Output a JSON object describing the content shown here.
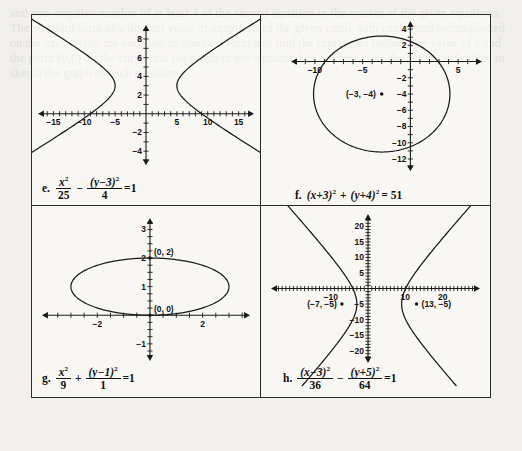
{
  "figure": {
    "border_color": "#2b2b2b",
    "background": "#f2f0ec",
    "panel_count": 4
  },
  "ghost_text": "and non-negative number of at least 1 of the second equation in the system of the given equations. The standard form of a distinct value of equations of the given circle with center and radius plotted on the axes. Write the equation in standard form and find the center and radius. The value of c and the point (0,0) on the curve that the graph of the equation has a vertex. Use the center and radius to sketch the graph of each equation.",
  "panels": [
    {
      "id": "e",
      "label": "e.",
      "curve_type": "hyperbola",
      "equation_text": "x^2/25 - (y-3)^2/4 = 1",
      "equation": {
        "term1": {
          "num": "x",
          "num_sup": "2",
          "den": "25"
        },
        "operator": "−",
        "term2": {
          "num": "(y−3)",
          "num_sup": "2",
          "den": "4"
        },
        "equals": "=1"
      },
      "axes": {
        "x_ticks": [
          "−15",
          "−10",
          "−5",
          "5",
          "10",
          "15"
        ],
        "x_tick_values": [
          -15,
          -10,
          -5,
          5,
          10,
          15
        ],
        "y_ticks": [
          "8",
          "6",
          "4",
          "2",
          "−2",
          "−4"
        ],
        "y_tick_values": [
          8,
          6,
          4,
          2,
          -2,
          -4
        ],
        "xlim": [
          -17.5,
          17.5
        ],
        "ylim": [
          -5.5,
          9.5
        ]
      },
      "center": [
        0,
        3
      ],
      "a": 5,
      "b": 2,
      "orientation": "horizontal"
    },
    {
      "id": "f",
      "label": "f.",
      "curve_type": "circle",
      "equation_text": "(x+3)^2 + (y+4)^2 = 51",
      "equation": {
        "term1": "(x+3)",
        "term1_sup": "2",
        "operator": "+",
        "term2": "(y+4)",
        "term2_sup": "2",
        "equals": "= 51"
      },
      "axes": {
        "x_ticks": [
          "−10",
          "−5",
          "5"
        ],
        "x_tick_values": [
          -10,
          -5,
          5
        ],
        "y_ticks": [
          "4",
          "2",
          "−2",
          "−4",
          "−6",
          "−8",
          "−10",
          "−12"
        ],
        "y_tick_values": [
          4,
          2,
          -2,
          -4,
          -6,
          -8,
          -10,
          -12
        ],
        "xlim": [
          -12.5,
          7.5
        ],
        "ylim": [
          -13.5,
          5.0
        ]
      },
      "center": [
        -3,
        -4
      ],
      "center_label": "(−3, −4)",
      "radius": 7.14
    },
    {
      "id": "g",
      "label": "g.",
      "curve_type": "ellipse",
      "equation_text": "x^2/9 + (y-1)^2/1 = 1",
      "equation": {
        "term1": {
          "num": "x",
          "num_sup": "2",
          "den": "9"
        },
        "operator": "+",
        "term2": {
          "num": "(y−1)",
          "num_sup": "2",
          "den": "1"
        },
        "equals": "=1"
      },
      "axes": {
        "x_ticks": [
          "−2",
          "2"
        ],
        "x_tick_values": [
          -2,
          2
        ],
        "y_ticks": [
          "3",
          "2",
          "1",
          "−1"
        ],
        "y_tick_values": [
          3,
          2,
          1,
          -1
        ],
        "xlim": [
          -4.1,
          3.8
        ],
        "ylim": [
          -1.6,
          3.4
        ]
      },
      "center": [
        0,
        1
      ],
      "a": 3,
      "b": 1,
      "point_labels": [
        {
          "text": "(0, 2)",
          "x": 0,
          "y": 2
        },
        {
          "text": "(0, 0)",
          "x": 0,
          "y": 0
        }
      ]
    },
    {
      "id": "h",
      "label": "h.",
      "curve_type": "hyperbola",
      "equation_text": "(x-3)^2/36 - (y+5)^2/64 = 1",
      "equation": {
        "term1": {
          "num": "(x−3)",
          "num_sup": "2",
          "den": "36"
        },
        "operator": "−",
        "term2": {
          "num": "(y+5)",
          "num_sup": "2",
          "den": "64"
        },
        "equals": "=1"
      },
      "axes": {
        "x_ticks": [
          "−10",
          "10",
          "20"
        ],
        "x_tick_values": [
          -10,
          10,
          20
        ],
        "y_ticks": [
          "20",
          "15",
          "10",
          "5",
          "−5",
          "−10",
          "−15",
          "−20"
        ],
        "y_tick_values": [
          20,
          15,
          10,
          5,
          -5,
          -10,
          -15,
          -20
        ],
        "xlim": [
          -26,
          30
        ],
        "ylim": [
          -24,
          24
        ]
      },
      "center": [
        3,
        -5
      ],
      "a": 6,
      "b": 8,
      "orientation": "horizontal",
      "point_labels": [
        {
          "text": "(−7, −5)",
          "x": -7,
          "y": -5,
          "side": "left"
        },
        {
          "text": "(13, −5)",
          "x": 13,
          "y": -5,
          "side": "right"
        }
      ]
    }
  ]
}
